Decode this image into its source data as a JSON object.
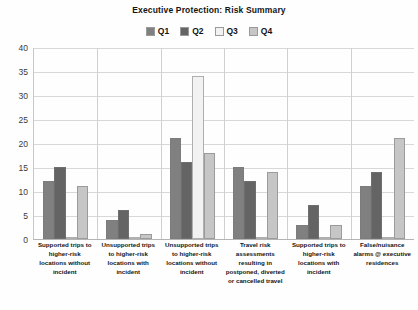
{
  "chart_data": {
    "type": "bar",
    "title": "Executive Protection: Risk Summary",
    "xlabel": "",
    "ylabel": "",
    "ylim": [
      0,
      40
    ],
    "ytick_step": 5,
    "yticks": [
      "40",
      "35",
      "30",
      "25",
      "20",
      "15",
      "10",
      "5",
      "0"
    ],
    "grid": true,
    "legend_position": "top",
    "categories": [
      "Supported trips to higher-risk locations without incident",
      "Unsupported trips to higher-risk locations with incident",
      "Unsupported trips to higher-risk locations without incident",
      "Travel risk assessments resulting in postponed, diverted or cancelled travel",
      "Supported trips to higher-risk locations with incident",
      "False/nuisance alarms @ executive residences"
    ],
    "series": [
      {
        "name": "Q1",
        "color": "#808080",
        "values": [
          12,
          4,
          21,
          15,
          3,
          11
        ]
      },
      {
        "name": "Q2",
        "color": "#646464",
        "values": [
          15,
          6,
          16,
          12,
          7,
          14
        ]
      },
      {
        "name": "Q3",
        "color": "#f2f2f2",
        "values": [
          0,
          0,
          34,
          0,
          0,
          0
        ]
      },
      {
        "name": "Q4",
        "color": "#c6c6c6",
        "values": [
          11,
          1,
          18,
          14,
          3,
          21
        ]
      }
    ]
  },
  "legend": {
    "items": [
      {
        "label": "Q1",
        "color": "#808080"
      },
      {
        "label": "Q2",
        "color": "#646464"
      },
      {
        "label": "Q3",
        "color": "#f2f2f2"
      },
      {
        "label": "Q4",
        "color": "#c6c6c6"
      }
    ]
  }
}
